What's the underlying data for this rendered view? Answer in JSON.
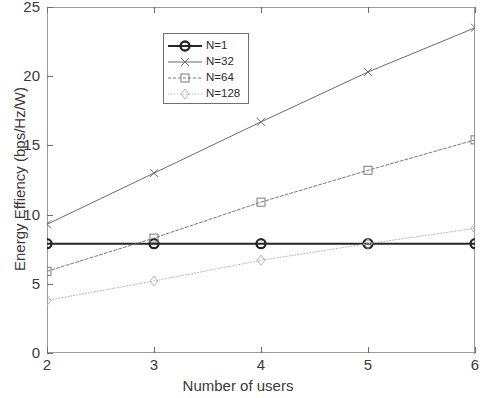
{
  "chart_data": {
    "type": "line",
    "title": "",
    "xlabel": "Number of users",
    "ylabel": "Energy Effiency (bps/Hz/W)",
    "x": [
      2,
      3,
      4,
      5,
      6
    ],
    "xlim": [
      2,
      6
    ],
    "ylim": [
      0,
      25
    ],
    "xticks": [
      "2",
      "3",
      "4",
      "5",
      "6"
    ],
    "yticks": [
      "0",
      "5",
      "10",
      "15",
      "20",
      "25"
    ],
    "grid": false,
    "legend_position": "upper center",
    "series": [
      {
        "name": "N=1",
        "marker": "circle",
        "values": [
          7.9,
          7.9,
          7.9,
          7.9,
          7.9
        ],
        "color": "#262626",
        "width": 1.9,
        "dash": "none"
      },
      {
        "name": "N=32",
        "marker": "cross",
        "values": [
          9.3,
          13.0,
          16.7,
          20.3,
          23.5
        ],
        "color": "#6b6b6b",
        "width": 1.0,
        "dash": "none"
      },
      {
        "name": "N=64",
        "marker": "square",
        "values": [
          5.9,
          8.3,
          10.9,
          13.2,
          15.4
        ],
        "color": "#7a7a7a",
        "width": 1.0,
        "dash": "3,2"
      },
      {
        "name": "N=128",
        "marker": "diamond",
        "values": [
          3.8,
          5.2,
          6.7,
          7.9,
          9.0
        ],
        "color": "#b4b4b4",
        "width": 1.0,
        "dash": "1,2"
      }
    ]
  },
  "legend": {
    "items": [
      {
        "label": "N=1"
      },
      {
        "label": "N=32"
      },
      {
        "label": "N=64"
      },
      {
        "label": "N=128"
      }
    ]
  }
}
